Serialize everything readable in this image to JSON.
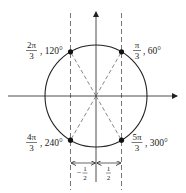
{
  "diagram": {
    "colors": {
      "stroke": "#222222",
      "dashed": "#444444",
      "point": "#111111",
      "background": "#ffffff"
    },
    "geometry": {
      "cx": 96,
      "cy": 96,
      "r": 51
    },
    "points": [
      {
        "id": "p60",
        "frac_num": "π",
        "frac_den": "3",
        "degrees": ", 60°",
        "angle_deg": 60
      },
      {
        "id": "p120",
        "frac_num": "2π",
        "frac_den": "3",
        "degrees": ", 120°",
        "angle_deg": 120
      },
      {
        "id": "p240",
        "frac_num": "4π",
        "frac_den": "3",
        "degrees": ", 240°",
        "angle_deg": 240
      },
      {
        "id": "p300",
        "frac_num": "5π",
        "frac_den": "3",
        "degrees": ", 300°",
        "angle_deg": 300
      }
    ],
    "dimensions": {
      "left": {
        "sign": "−",
        "num": "1",
        "den": "2"
      },
      "right": {
        "sign": "",
        "num": "1",
        "den": "2"
      }
    }
  }
}
